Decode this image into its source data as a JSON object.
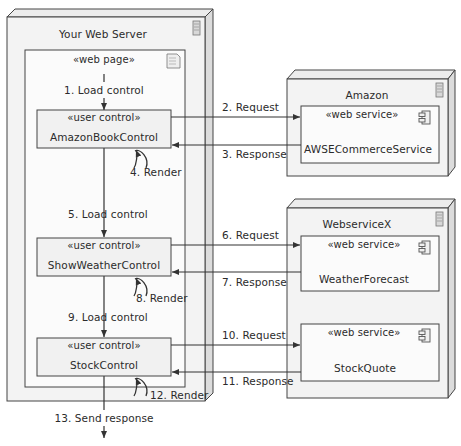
{
  "diagram": {
    "type": "UML deployment/interaction diagram",
    "colors": {
      "node_fill": "#f4f4f4",
      "node_side": "#e2e2e2",
      "box_fill": "#fafafa",
      "line": "#333333"
    },
    "nodes": [
      {
        "id": "server",
        "title": "Your Web Server",
        "icon": "server-icon",
        "inner": {
          "stereotype": "«web page»",
          "icon": "document-icon",
          "controls": [
            {
              "stereotype": "«user control»",
              "name": "AmazonBookControl"
            },
            {
              "stereotype": "«user control»",
              "name": "ShowWeatherControl"
            },
            {
              "stereotype": "«user control»",
              "name": "StockControl"
            }
          ]
        }
      },
      {
        "id": "amazon",
        "title": "Amazon",
        "icon": "server-icon",
        "services": [
          {
            "stereotype": "«web service»",
            "name": "AWSECommerceService",
            "icon": "component-icon"
          }
        ]
      },
      {
        "id": "webservicex",
        "title": "WebserviceX",
        "icon": "server-icon",
        "services": [
          {
            "stereotype": "«web service»",
            "name": "WeatherForecast",
            "icon": "component-icon"
          },
          {
            "stereotype": "«web service»",
            "name": "StockQuote",
            "icon": "component-icon"
          }
        ]
      }
    ],
    "messages": [
      "1. Load control",
      "2. Request",
      "3. Response",
      "4. Render",
      "5. Load control",
      "6. Request",
      "7. Response",
      "8. Render",
      "9. Load control",
      "10. Request",
      "11. Response",
      "12. Render",
      "13. Send response"
    ]
  }
}
